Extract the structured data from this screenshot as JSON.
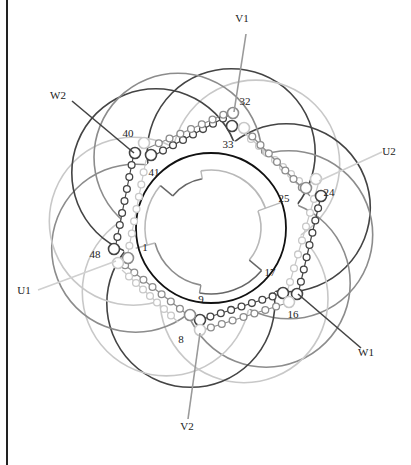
{
  "diagram": {
    "type": "three-phase stator winding diagram",
    "center": [
      212,
      228
    ],
    "terminals": [
      {
        "id": "V1",
        "label": "V1",
        "x": 242,
        "y": 22,
        "lx": 246,
        "ly": 34,
        "tx": 234,
        "ty": 112,
        "color": "#9a9a9a"
      },
      {
        "id": "U2",
        "label": "U2",
        "x": 389,
        "y": 155,
        "lx": 382,
        "ly": 152,
        "tx": 319,
        "ty": 181,
        "color": "#d0d0d0"
      },
      {
        "id": "W2",
        "label": "W2",
        "x": 58,
        "y": 99,
        "lx": 72,
        "ly": 101,
        "tx": 134,
        "ty": 153,
        "color": "#444444"
      },
      {
        "id": "U1",
        "label": "U1",
        "x": 24,
        "y": 294,
        "lx": 38,
        "ly": 290,
        "tx": 116,
        "ty": 261,
        "color": "#d0d0d0"
      },
      {
        "id": "V2",
        "label": "V2",
        "x": 187,
        "y": 430,
        "lx": 188,
        "ly": 419,
        "tx": 200,
        "ty": 333,
        "color": "#9a9a9a"
      },
      {
        "id": "W1",
        "label": "W1",
        "x": 366,
        "y": 356,
        "lx": 361,
        "ly": 348,
        "tx": 298,
        "ty": 294,
        "color": "#444444"
      }
    ],
    "slot_labels": [
      {
        "label": "32",
        "x": 245,
        "y": 105
      },
      {
        "label": "33",
        "x": 228,
        "y": 148
      },
      {
        "label": "40",
        "x": 128,
        "y": 137
      },
      {
        "label": "41",
        "x": 154,
        "y": 176
      },
      {
        "label": "24",
        "x": 329,
        "y": 196
      },
      {
        "label": "25",
        "x": 284,
        "y": 202
      },
      {
        "label": "48",
        "x": 95,
        "y": 258
      },
      {
        "label": "1",
        "x": 145,
        "y": 251
      },
      {
        "label": "17",
        "x": 270,
        "y": 276
      },
      {
        "label": "16",
        "x": 293,
        "y": 318
      },
      {
        "label": "9",
        "x": 201,
        "y": 303
      },
      {
        "label": "8",
        "x": 181,
        "y": 343
      }
    ],
    "colors": {
      "phase_dark": "#444444",
      "phase_mid": "#8c8c8c",
      "phase_light": "#c8c8c8",
      "core": "#111111",
      "background": "#ffffff"
    }
  }
}
